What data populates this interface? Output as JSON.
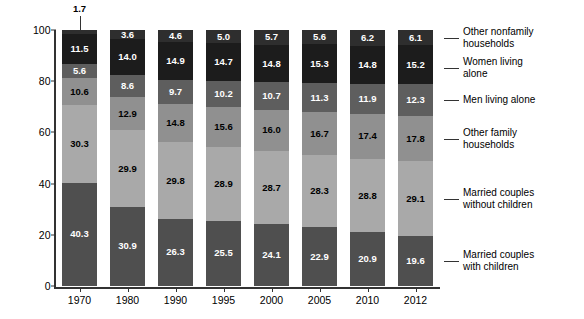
{
  "chart_data": {
    "type": "bar",
    "subtype": "stacked-bar-100",
    "title": "",
    "xlabel": "",
    "ylabel": "Percentage of Households",
    "ylim": [
      0,
      100
    ],
    "yticks": [
      0,
      20,
      40,
      60,
      80,
      100
    ],
    "grid": false,
    "legend_position": "right",
    "categories": [
      "1970",
      "1980",
      "1990",
      "1995",
      "2000",
      "2005",
      "2010",
      "2012"
    ],
    "series": [
      {
        "name": "Married couples with children",
        "color": "#4f4f4f",
        "label_color": "light",
        "values": [
          40.3,
          30.9,
          26.3,
          25.5,
          24.1,
          22.9,
          20.9,
          19.6
        ]
      },
      {
        "name": "Married couples without children",
        "color": "#a9a9a9",
        "label_color": "dark",
        "values": [
          30.3,
          29.9,
          29.8,
          28.9,
          28.7,
          28.3,
          28.8,
          29.1
        ]
      },
      {
        "name": "Other family households",
        "color": "#909090",
        "label_color": "dark",
        "values": [
          10.6,
          12.9,
          14.8,
          15.6,
          16.0,
          16.7,
          17.4,
          17.8
        ]
      },
      {
        "name": "Men living alone",
        "color": "#5e5e5e",
        "label_color": "light",
        "values": [
          5.6,
          8.6,
          9.7,
          10.2,
          10.7,
          11.3,
          11.9,
          12.3
        ]
      },
      {
        "name": "Women living alone",
        "color": "#1c1c1c",
        "label_color": "light",
        "values": [
          11.5,
          14.0,
          14.9,
          14.7,
          14.8,
          15.3,
          14.8,
          15.2
        ]
      },
      {
        "name": "Other nonfamily households",
        "color": "#2e2e2e",
        "label_color": "light",
        "values": [
          1.7,
          3.6,
          4.6,
          5.0,
          5.7,
          5.6,
          6.2,
          6.1
        ]
      }
    ],
    "callouts": [
      {
        "category": "1970",
        "series": "Other nonfamily households",
        "value": "1.7"
      }
    ],
    "legend": [
      "Other nonfamily\nhouseholds",
      "Women living\nalone",
      "Men living alone",
      "Other family\nhouseholds",
      "Married couples\nwithout children",
      "Married couples\nwith children"
    ]
  }
}
